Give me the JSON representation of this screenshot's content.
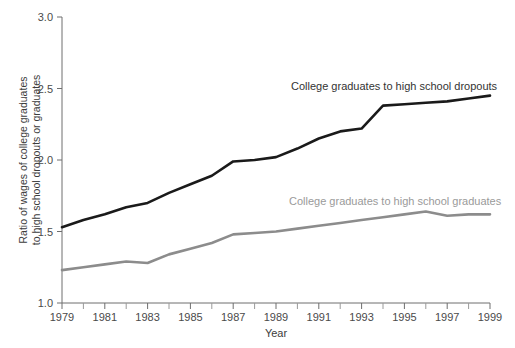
{
  "chart_data": {
    "type": "line",
    "title": "",
    "xlabel": "Year",
    "ylabel_line1": "Ratio of wages of college graduates",
    "ylabel_line2": "to high school dropouts or graduates",
    "xlim": [
      1979,
      1999
    ],
    "ylim": [
      1.0,
      3.0
    ],
    "grid": false,
    "legend_position": "inline-annotation",
    "x_major_ticks": [
      1979,
      1981,
      1983,
      1985,
      1987,
      1989,
      1991,
      1993,
      1995,
      1997,
      1999
    ],
    "x_major_tick_labels": [
      "1979",
      "1981",
      "1983",
      "1985",
      "1987",
      "1989",
      "1991",
      "1993",
      "1995",
      "1997",
      "1999"
    ],
    "x_minor_ticks": [
      1980,
      1982,
      1984,
      1986,
      1988,
      1990,
      1992,
      1994,
      1996,
      1998
    ],
    "y_ticks": [
      1.0,
      1.5,
      2.0,
      2.5,
      3.0
    ],
    "y_tick_labels": [
      "1.0",
      "1.5",
      "2.0",
      "2.5",
      "3.0"
    ],
    "x": [
      1979,
      1980,
      1981,
      1982,
      1983,
      1984,
      1985,
      1986,
      1987,
      1988,
      1989,
      1990,
      1991,
      1992,
      1993,
      1994,
      1995,
      1996,
      1997,
      1998,
      1999
    ],
    "series": [
      {
        "name": "College graduates to high school dropouts",
        "color": "#1a1a1a",
        "line_width": 2.6,
        "annotation": "College graduates to high school dropouts",
        "values": [
          1.53,
          1.58,
          1.62,
          1.67,
          1.7,
          1.77,
          1.83,
          1.89,
          1.99,
          2.0,
          2.02,
          2.08,
          2.15,
          2.2,
          2.22,
          2.38,
          2.39,
          2.4,
          2.41,
          2.43,
          2.45
        ]
      },
      {
        "name": "College graduates to high school graduates",
        "color": "#8c8c8c",
        "line_width": 2.6,
        "annotation": "College graduates to high school graduates",
        "values": [
          1.23,
          1.25,
          1.27,
          1.29,
          1.28,
          1.34,
          1.38,
          1.42,
          1.48,
          1.49,
          1.5,
          1.52,
          1.54,
          1.56,
          1.58,
          1.6,
          1.62,
          1.64,
          1.61,
          1.62,
          1.62
        ]
      }
    ]
  },
  "annotations": {
    "upper": "College graduates to high school dropouts",
    "lower": "College graduates to high school graduates",
    "upper_color": "#333333",
    "lower_color": "#9a9a9a"
  },
  "axis": {
    "x_title": "Year",
    "y_title_line1": "Ratio of wages of college graduates",
    "y_title_line2": "to high school dropouts or graduates"
  }
}
